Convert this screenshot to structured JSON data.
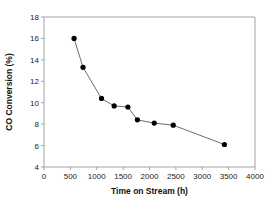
{
  "chart_data": {
    "type": "line",
    "title": "",
    "xlabel": "Time on Stream (h)",
    "ylabel": "CO Conversion (%)",
    "xlim": [
      0,
      4000
    ],
    "ylim": [
      4,
      18
    ],
    "xticks": [
      0,
      500,
      1000,
      1500,
      2000,
      2500,
      3000,
      3500,
      4000
    ],
    "yticks": [
      4,
      6,
      8,
      10,
      12,
      14,
      16,
      18
    ],
    "xtick_labels": [
      "0",
      "500",
      "1000",
      "1500",
      "2000",
      "2500",
      "3000",
      "3500",
      "4000"
    ],
    "ytick_labels": [
      "4",
      "6",
      "8",
      "10",
      "12",
      "14",
      "16",
      "18"
    ],
    "grid": false,
    "legend": false,
    "marker": "filled-circle",
    "marker_color": "#000000",
    "line_color": "#6e6e6e",
    "series": [
      {
        "name": "CO Conversion",
        "x": [
          570,
          740,
          1090,
          1330,
          1590,
          1770,
          2090,
          2450,
          3420
        ],
        "y": [
          16.0,
          13.3,
          10.4,
          9.7,
          9.6,
          8.4,
          8.1,
          7.9,
          6.1
        ]
      }
    ]
  },
  "axes": {
    "x_axis_title": "Time on Stream (h)",
    "y_axis_title": "CO Conversion (%)"
  }
}
